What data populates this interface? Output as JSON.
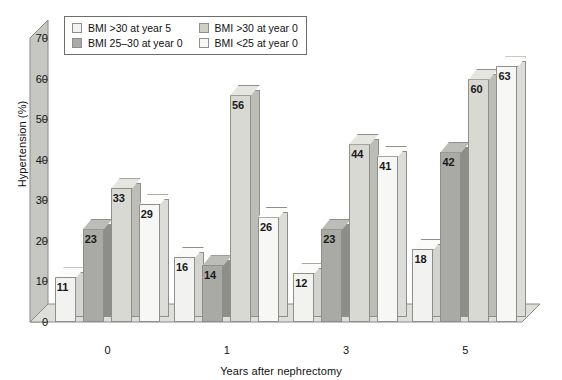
{
  "chart_data": {
    "type": "bar",
    "title": "",
    "xlabel": "Years after nephrectomy",
    "ylabel": "Hypertension (%)",
    "categories": [
      "0",
      "1",
      "3",
      "5"
    ],
    "ylim": [
      0,
      70
    ],
    "yticks": [
      0,
      10,
      20,
      30,
      40,
      50,
      60,
      70
    ],
    "grid": false,
    "legend_position": "top-left",
    "three_d": true,
    "series": [
      {
        "name": "BMI >30 at year 5",
        "values": [
          11,
          16,
          12,
          18
        ],
        "color": "#f2f2f0"
      },
      {
        "name": "BMI 25–30 at year 0",
        "values": [
          23,
          14,
          23,
          42
        ],
        "color": "#a9a9a5"
      },
      {
        "name": "BMI >30 at year 0",
        "values": [
          33,
          56,
          44,
          60
        ],
        "color": "#cfcfca"
      },
      {
        "name": "BMI <25 at year 0",
        "values": [
          29,
          26,
          41,
          63
        ],
        "color": "#f7f7f5"
      }
    ]
  }
}
